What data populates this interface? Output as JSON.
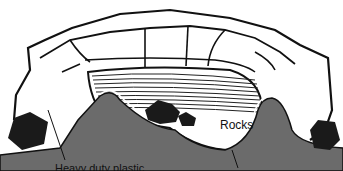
{
  "diagram": {
    "labels": {
      "rocks": "Rocks",
      "plastic": "Heavy duty plastic"
    },
    "colors": {
      "ground": "#6b6b6b",
      "outline": "#111111",
      "rock_fill": "#1a1a1a",
      "water_lines": "#222222",
      "background": "#ffffff"
    }
  }
}
